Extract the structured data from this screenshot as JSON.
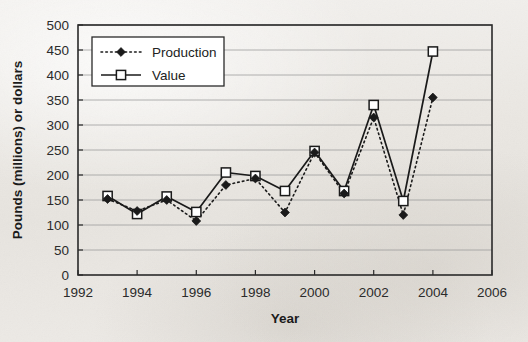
{
  "chart_data": {
    "type": "line",
    "title": "",
    "xlabel": "Year",
    "ylabel": "Pounds (millions) or dollars",
    "xlim": [
      1992,
      2006
    ],
    "ylim": [
      0,
      500
    ],
    "xticks": [
      1992,
      1994,
      1996,
      1998,
      2000,
      2002,
      2004,
      2006
    ],
    "yticks": [
      0,
      50,
      100,
      150,
      200,
      250,
      300,
      350,
      400,
      450,
      500
    ],
    "grid": "horizontal",
    "legend_position": "upper-left-inside",
    "x": [
      1993,
      1994,
      1995,
      1996,
      1997,
      1998,
      1999,
      2000,
      2001,
      2002,
      2003,
      2004
    ],
    "series": [
      {
        "name": "Production",
        "marker": "filled-diamond",
        "line_style": "dotted",
        "color": "#1a1a1a",
        "values": [
          152,
          128,
          150,
          108,
          180,
          193,
          125,
          245,
          163,
          315,
          120,
          355
        ]
      },
      {
        "name": "Value",
        "marker": "open-square",
        "line_style": "solid",
        "color": "#1a1a1a",
        "values": [
          158,
          122,
          157,
          126,
          205,
          198,
          168,
          248,
          168,
          340,
          148,
          447
        ]
      }
    ]
  },
  "axis": {
    "y_tick_labels": [
      "500",
      "450",
      "400",
      "350",
      "300",
      "250",
      "200",
      "150",
      "100",
      "50",
      "0"
    ],
    "x_tick_labels": [
      "1992",
      "1994",
      "1996",
      "1998",
      "2000",
      "2002",
      "2004",
      "2006"
    ],
    "y_axis_title": "Pounds (millions) or dollars",
    "x_axis_title": "Year"
  },
  "legend": {
    "entries": [
      {
        "label": "Production",
        "marker": "filled-diamond",
        "style": "dotted"
      },
      {
        "label": "Value",
        "marker": "open-square",
        "style": "solid"
      }
    ]
  },
  "colors": {
    "ink": "#1a1a1a",
    "grid": "#9a9a9a",
    "frame": "#2a2a2a",
    "paper": "#ece9e5"
  }
}
